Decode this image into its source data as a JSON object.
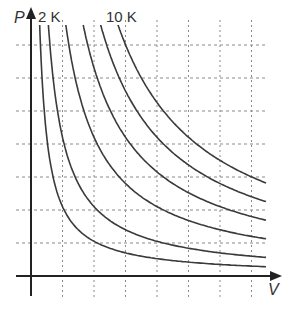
{
  "chart_data": {
    "type": "line",
    "title": "",
    "xlabel": "V",
    "ylabel": "P",
    "grid": true,
    "legend": "none",
    "annotations": [
      "2 K",
      "10 K"
    ],
    "series_note": "Isotherms P = kT/V",
    "series": [
      {
        "name": "1 K",
        "k": 1
      },
      {
        "name": "2 K",
        "k": 2
      },
      {
        "name": "4 K",
        "k": 4
      },
      {
        "name": "6 K",
        "k": 6
      },
      {
        "name": "8 K",
        "k": 8
      },
      {
        "name": "10 K",
        "k": 10
      }
    ],
    "xlim": [
      0,
      7.5
    ],
    "ylim": [
      0,
      7.5
    ]
  },
  "labels": {
    "y_axis": "P",
    "x_axis": "V",
    "curve_low": "2 K",
    "curve_high": "10 K"
  },
  "colors": {
    "curve": "#3a3a3a",
    "axis": "#222222",
    "grid": "#8a8a8a"
  }
}
